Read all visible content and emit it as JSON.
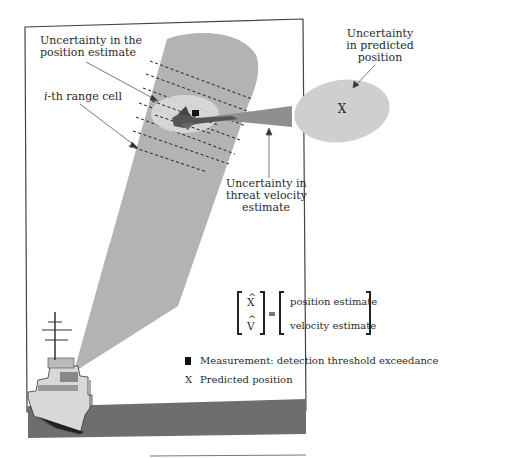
{
  "diagram": {
    "type": "radar tracking illustration",
    "labels": {
      "position_uncertainty": [
        "Uncertainty in the",
        "position estimate"
      ],
      "range_cell": "-th range cell",
      "range_cell_index": "i",
      "predicted_uncertainty": [
        "Uncertainty",
        "in predicted",
        "position"
      ],
      "velocity_uncertainty": [
        "Uncertainty in",
        "threat velocity",
        "estimate"
      ],
      "predicted_marker": "X"
    },
    "state_equation": {
      "lhs": [
        "X",
        "V"
      ],
      "hat_symbol": "^",
      "equals": "=",
      "rhs": [
        "position estimate",
        "velocity estimate"
      ]
    },
    "legend": [
      {
        "symbol": "filled-square",
        "label": "Measurement: detection threshold exceedance"
      },
      {
        "symbol": "X",
        "label": "Predicted position"
      }
    ],
    "colors": {
      "beam": "#b3b3b3",
      "position_ellipse": "#d6d6d6",
      "predicted_ellipse": "#cfcfcf",
      "velocity_cone": "#8f8f8f",
      "sea": "#6e6e6e",
      "frame": "#444444"
    }
  }
}
